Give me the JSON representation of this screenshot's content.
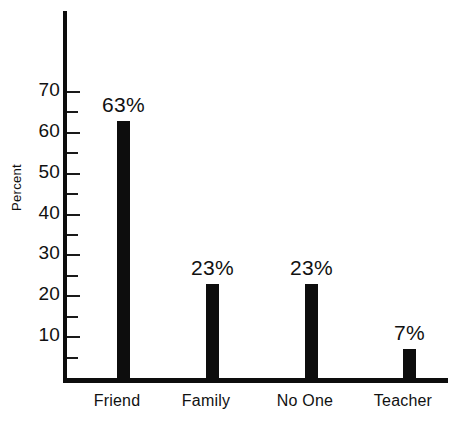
{
  "chart_data": {
    "type": "bar",
    "title": "",
    "xlabel": "",
    "ylabel": "Percent",
    "categories": [
      "Friend",
      "Family",
      "No One",
      "Teacher"
    ],
    "values": [
      63,
      23,
      23,
      7
    ],
    "data_labels": [
      "63%",
      "23%",
      "23%",
      "7%"
    ],
    "ylim": [
      0,
      78
    ],
    "y_major_ticks": [
      10,
      20,
      30,
      40,
      50,
      60,
      70
    ],
    "y_major_tick_labels": [
      "10",
      "20",
      "30",
      "40",
      "50",
      "60",
      "70"
    ],
    "y_minor_ticks": [
      5,
      15,
      25,
      35,
      45,
      55,
      65
    ],
    "grid": false,
    "legend": null,
    "bar_color": "#0d0d0d",
    "axis_color": "#0d0d0d",
    "background_color": "#ffffff"
  }
}
